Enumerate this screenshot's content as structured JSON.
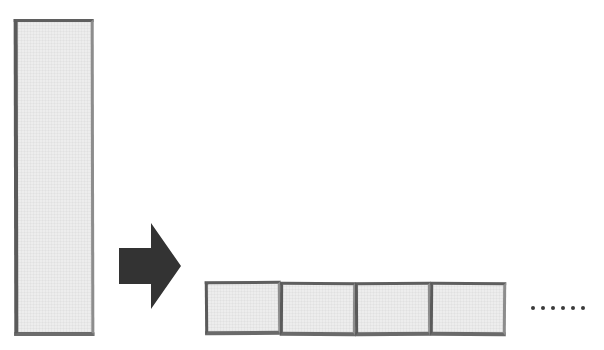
{
  "figure": {
    "background_color": "#ffffff",
    "width": 604,
    "height": 350,
    "cropped_caption_text": "",
    "shape_fill_color": "#ededed",
    "shape_border_color": "#5f5f5f",
    "arrow_color": "#333333",
    "dot_color": "#3a3a3a"
  },
  "source_block": {
    "name": "tall-block",
    "label": "",
    "shape": "rectangle",
    "orientation": "vertical"
  },
  "arrow": {
    "name": "transform-arrow",
    "direction": "right",
    "label": ""
  },
  "result_row": {
    "label": "",
    "squares": [
      {
        "label": ""
      },
      {
        "label": ""
      },
      {
        "label": ""
      },
      {
        "label": ""
      }
    ],
    "ellipsis": {
      "label": "......",
      "dot_count": 6
    }
  }
}
